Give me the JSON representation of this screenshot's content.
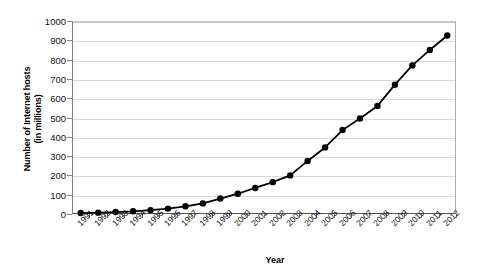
{
  "chart_data": {
    "type": "line",
    "title": "",
    "xlabel": "Year",
    "ylabel": "Number of Internet hosts (in millions)",
    "ylabel_line1": "Number of Internet hosts",
    "ylabel_line2": "(in millions)",
    "ylim": [
      0,
      1000
    ],
    "ytick_step": 100,
    "yticks": [
      0,
      100,
      200,
      300,
      400,
      500,
      600,
      700,
      800,
      900,
      1000
    ],
    "grid": true,
    "legend": "none",
    "marker": "filled-circle",
    "line_color": "#000000",
    "marker_color": "#000000",
    "grid_color": "#d9d9d9",
    "categories": [
      "1991",
      "1992",
      "1993",
      "1994",
      "1995",
      "1996",
      "1997",
      "1998",
      "1999",
      "2000",
      "2001",
      "2002",
      "2003",
      "2004",
      "2005",
      "2006",
      "2007",
      "2008",
      "2009",
      "2010",
      "2011",
      "2012"
    ],
    "values": [
      5,
      7,
      10,
      14,
      20,
      28,
      40,
      55,
      80,
      105,
      135,
      165,
      200,
      275,
      345,
      435,
      495,
      560,
      670,
      770,
      850,
      925
    ],
    "series": [
      {
        "name": "Internet hosts",
        "values": [
          5,
          7,
          10,
          14,
          20,
          28,
          40,
          55,
          80,
          105,
          135,
          165,
          200,
          275,
          345,
          435,
          495,
          560,
          670,
          770,
          850,
          925
        ]
      }
    ]
  }
}
